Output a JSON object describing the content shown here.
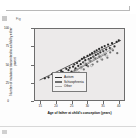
{
  "page": {
    "figure_tag": "Fig",
    "corner_marker": "page-marker"
  },
  "chart_data": {
    "type": "scatter",
    "title": "",
    "xlabel": "Age of father at child's conception (years)",
    "ylabel": "Number of mutations transmitted to a child by either parent",
    "xlim": [
      13,
      42
    ],
    "ylim": [
      0,
      100
    ],
    "xticks": [
      15,
      20,
      25,
      30,
      35,
      40
    ],
    "yticks": [
      0,
      25,
      50,
      75,
      100
    ],
    "grid": false,
    "legend_position": "inside-bottom-right",
    "legend": [
      {
        "label": "Autism",
        "color": "#2b2b2b"
      },
      {
        "label": "Schizophrenia",
        "color": "#6e6e6e"
      },
      {
        "label": "Other",
        "color": "#a8a8a8"
      }
    ],
    "series": [
      {
        "name": "Autism",
        "color": "#2b2b2b",
        "marker": "filled-circle",
        "points": [
          [
            16.2,
            30.5
          ],
          [
            17.4,
            32.0
          ],
          [
            18.6,
            36.5
          ],
          [
            19.3,
            31.0
          ],
          [
            20.1,
            38.0
          ],
          [
            20.8,
            35.0
          ],
          [
            21.5,
            41.0
          ],
          [
            22.0,
            39.5
          ],
          [
            22.6,
            34.0
          ],
          [
            23.2,
            44.0
          ],
          [
            23.9,
            42.0
          ],
          [
            24.3,
            45.5
          ],
          [
            24.9,
            40.0
          ],
          [
            25.4,
            47.0
          ],
          [
            25.8,
            50.0
          ],
          [
            26.2,
            44.5
          ],
          [
            26.7,
            52.0
          ],
          [
            27.1,
            48.0
          ],
          [
            27.5,
            55.0
          ],
          [
            27.9,
            50.5
          ],
          [
            28.3,
            58.0
          ],
          [
            28.7,
            53.0
          ],
          [
            29.0,
            60.0
          ],
          [
            29.4,
            56.0
          ],
          [
            29.8,
            49.0
          ],
          [
            30.1,
            62.0
          ],
          [
            30.5,
            57.5
          ],
          [
            30.9,
            64.0
          ],
          [
            31.2,
            59.0
          ],
          [
            31.6,
            66.0
          ],
          [
            32.0,
            61.0
          ],
          [
            32.4,
            68.0
          ],
          [
            32.8,
            63.5
          ],
          [
            33.1,
            70.0
          ],
          [
            33.5,
            65.0
          ],
          [
            33.9,
            72.0
          ],
          [
            34.3,
            67.0
          ],
          [
            34.8,
            74.0
          ],
          [
            35.2,
            69.0
          ],
          [
            35.7,
            76.0
          ],
          [
            36.2,
            71.0
          ],
          [
            36.8,
            78.0
          ],
          [
            37.4,
            73.0
          ],
          [
            38.1,
            80.0
          ],
          [
            38.9,
            75.5
          ],
          [
            39.6,
            82.0
          ],
          [
            40.3,
            84.0
          ]
        ]
      },
      {
        "name": "Schizophrenia",
        "color": "#6e6e6e",
        "marker": "filled-circle",
        "points": [
          [
            19.8,
            26.5
          ],
          [
            21.2,
            29.0
          ],
          [
            23.0,
            33.0
          ],
          [
            24.6,
            37.5
          ],
          [
            25.2,
            31.5
          ],
          [
            26.0,
            42.0
          ],
          [
            27.3,
            38.5
          ],
          [
            28.1,
            46.0
          ],
          [
            28.9,
            43.0
          ],
          [
            29.6,
            51.0
          ],
          [
            30.3,
            47.5
          ],
          [
            31.0,
            55.0
          ],
          [
            31.8,
            50.0
          ],
          [
            32.6,
            58.5
          ],
          [
            33.3,
            54.0
          ],
          [
            34.0,
            61.0
          ],
          [
            34.9,
            57.0
          ],
          [
            35.8,
            64.0
          ],
          [
            36.6,
            59.5
          ],
          [
            37.5,
            67.0
          ],
          [
            38.4,
            70.0
          ],
          [
            39.8,
            66.0
          ]
        ]
      },
      {
        "name": "Other",
        "color": "#9a9a9a",
        "marker": "open-circle",
        "points": [
          [
            22.4,
            31.0
          ],
          [
            25.0,
            36.0
          ],
          [
            26.5,
            41.5
          ],
          [
            28.0,
            45.0
          ],
          [
            29.2,
            52.5
          ],
          [
            30.7,
            56.0
          ],
          [
            31.4,
            48.5
          ],
          [
            32.2,
            60.0
          ],
          [
            33.7,
            64.5
          ],
          [
            34.6,
            58.0
          ],
          [
            35.4,
            68.5
          ],
          [
            36.4,
            62.0
          ],
          [
            37.8,
            72.0
          ]
        ]
      }
    ],
    "trend_lines": [
      {
        "name": "Autism",
        "color": "#1f1f1f",
        "x0": 14.5,
        "y0": 28.0,
        "x1": 41.0,
        "y1": 84.0
      },
      {
        "name": "Schizophrenia",
        "color": "#555555",
        "x0": 24.0,
        "y0": 36.0,
        "x1": 36.5,
        "y1": 66.0
      },
      {
        "name": "Other",
        "color": "#8f8f8f",
        "x0": 21.5,
        "y0": 31.0,
        "x1": 38.5,
        "y1": 73.0
      }
    ]
  }
}
